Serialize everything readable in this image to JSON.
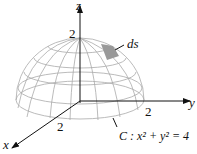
{
  "axes": {
    "x": "x",
    "y": "y",
    "z": "z"
  },
  "ticks": {
    "z": "2",
    "y": "2",
    "x": "2"
  },
  "element_label": "ds",
  "curve_label": "C : x² + y² = 4",
  "colors": {
    "grid": "#aaaaaa",
    "axis": "#111111",
    "patch": "#999999"
  }
}
